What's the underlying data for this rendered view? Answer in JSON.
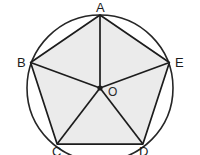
{
  "figure": {
    "shape_type": "geometry-diagram",
    "canvas": {
      "width": 200,
      "height": 155
    },
    "colors": {
      "background": "#ffffff",
      "pentagon_fill": "#ebebeb",
      "stroke": "#1c1c1c",
      "circle_stroke": "#262626",
      "label_color": "#1c1c1c"
    },
    "circle": {
      "label": "circumscribed circle",
      "center_x": 100,
      "center_y": 88,
      "radius": 73,
      "stroke_width": 1.6
    },
    "center_point": {
      "label": "O",
      "x": 100,
      "y": 88,
      "dot_radius": 2.6,
      "label_x": 108,
      "label_y": 88
    },
    "vertices": [
      {
        "name": "A",
        "label": "A",
        "x": 100,
        "y": 15,
        "label_x": 100,
        "label_y": 3,
        "label_anchor": "center"
      },
      {
        "name": "B",
        "label": "B",
        "x": 30.6,
        "y": 62.5,
        "label_x": 18,
        "label_y": 56,
        "label_anchor": "left"
      },
      {
        "name": "C",
        "label": "C",
        "x": 57.1,
        "y": 144.1,
        "label_x": 52,
        "label_y": 147,
        "label_anchor": "left"
      },
      {
        "name": "D",
        "label": "D",
        "x": 142.9,
        "y": 144.1,
        "label_x": 140,
        "label_y": 147,
        "label_anchor": "left"
      },
      {
        "name": "E",
        "label": "E",
        "x": 169.4,
        "y": 62.5,
        "label_x": 175,
        "label_y": 56,
        "label_anchor": "left"
      }
    ],
    "pentagon": {
      "name": "pentagon-ABCDE",
      "points": "100,15 169.4,62.5 142.9,144.1 57.1,144.1 30.6,62.5",
      "sides": [
        "AB",
        "BC",
        "CD",
        "DE",
        "EA"
      ],
      "stroke_width": 1.7
    },
    "radii": [
      {
        "name": "OA",
        "x2": 100,
        "y2": 15
      },
      {
        "name": "OB",
        "x2": 30.6,
        "y2": 62.5
      },
      {
        "name": "OC",
        "x2": 57.1,
        "y2": 144.1
      },
      {
        "name": "OD",
        "x2": 142.9,
        "y2": 144.1
      },
      {
        "name": "OE",
        "x2": 169.4,
        "y2": 62.5
      }
    ],
    "triangles": [
      "AOB",
      "BOC",
      "COD",
      "DOE",
      "EOA"
    ]
  }
}
